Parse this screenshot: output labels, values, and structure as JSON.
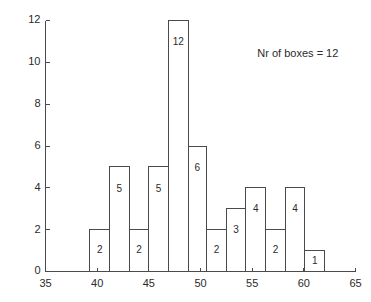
{
  "chart_data": {
    "type": "bar",
    "title": "",
    "subtitle": "",
    "xlabel": "",
    "ylabel": "",
    "xlim": [
      35,
      65
    ],
    "ylim": [
      0,
      12
    ],
    "xticks": [
      35,
      40,
      45,
      50,
      55,
      60,
      65
    ],
    "xtick_labels": [
      "35",
      "40",
      "45",
      "50",
      "55",
      "60",
      "65"
    ],
    "yticks": [
      0,
      2,
      4,
      6,
      8,
      10,
      12
    ],
    "ytick_labels": [
      "0",
      "2",
      "4",
      "6",
      "8",
      "10",
      "12"
    ],
    "grid": false,
    "legend": null,
    "bin_edges": [
      39.3,
      41.2,
      43.1,
      45.0,
      46.9,
      48.8,
      50.6,
      52.5,
      54.4,
      56.3,
      58.2,
      60.1,
      62.0
    ],
    "categories": [
      "39.3-41.2",
      "41.2-43.1",
      "43.1-45.0",
      "45.0-46.9",
      "46.9-48.8",
      "48.8-50.6",
      "50.6-52.5",
      "52.5-54.4",
      "54.4-56.3",
      "56.3-58.2",
      "58.2-60.1",
      "60.1-62.0"
    ],
    "values": [
      2,
      5,
      2,
      5,
      12,
      6,
      2,
      3,
      4,
      2,
      4,
      1
    ],
    "bar_labels": [
      "2",
      "5",
      "2",
      "5",
      "12",
      "6",
      "2",
      "3",
      "4",
      "2",
      "4",
      "1"
    ],
    "annotations": [
      {
        "text": "Nr of boxes = 12",
        "x": 55.5,
        "y": 10.4
      }
    ],
    "colors": {
      "bar_stroke": "#4a4a4a",
      "bar_fill": "none",
      "axis": "#4a4a4a",
      "text": "#2b2b2b",
      "background": "#ffffff"
    }
  }
}
